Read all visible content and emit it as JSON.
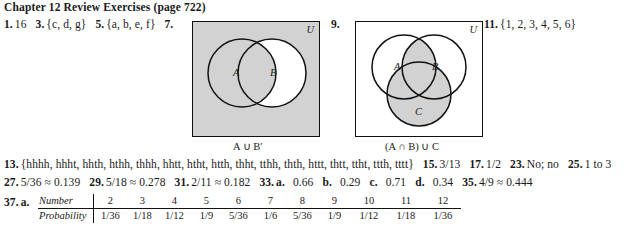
{
  "header": {
    "title": "Chapter 12 Review Exercises (page 722)"
  },
  "line1": {
    "items": [
      {
        "num": "1.",
        "text": "16"
      },
      {
        "num": "3.",
        "text": "{c, d, g}"
      },
      {
        "num": "5.",
        "text": "{a, b, e, f}"
      },
      {
        "num": "7.",
        "text": ""
      }
    ]
  },
  "venn1": {
    "problem": "7.",
    "universe_label": "U",
    "set_a_label": "A",
    "set_b_label": "B",
    "caption": "A ∪ B′",
    "shade_color": "#d2d2d2"
  },
  "venn2": {
    "problem": "9.",
    "universe_label": "U",
    "set_a_label": "A",
    "set_b_label": "B",
    "set_c_label": "C",
    "caption": "(A ∩ B) ∪ C",
    "shade_color": "#d2d2d2"
  },
  "item11": {
    "num": "11.",
    "text": "{1, 2, 3, 4, 5, 6}"
  },
  "line13": {
    "items": [
      {
        "num": "13.",
        "text": "{hhhh, hhht, hhth, hthh, thhh, hhtt, htht, htth, thht, tthh, thth, httt, thtt, ttht, ttth, tttt}"
      },
      {
        "num": "15.",
        "text": "3/13"
      },
      {
        "num": "17.",
        "text": "1/2"
      },
      {
        "num": "23.",
        "text": "No; no"
      },
      {
        "num": "25.",
        "text": "1 to 3"
      }
    ]
  },
  "line27": {
    "items": [
      {
        "num": "27.",
        "text": "5/36 ≈ 0.139"
      },
      {
        "num": "29.",
        "text": "5/18 ≈ 0.278"
      },
      {
        "num": "31.",
        "text": "2/11 ≈ 0.182"
      }
    ]
  },
  "line33": {
    "num": "33.",
    "parts": [
      {
        "label": "a.",
        "value": "0.66"
      },
      {
        "label": "b.",
        "value": "0.29"
      },
      {
        "label": "c.",
        "value": "0.71"
      },
      {
        "label": "d.",
        "value": "0.34"
      }
    ],
    "item35": {
      "num": "35.",
      "text": "4/9 ≈ 0.444"
    }
  },
  "line37": {
    "num": "37.",
    "part": "a.",
    "table": {
      "row_headers": [
        "Number",
        "Probability"
      ],
      "numbers": [
        "2",
        "3",
        "4",
        "5",
        "6",
        "7",
        "8",
        "9",
        "10",
        "11",
        "12"
      ],
      "probabilities": [
        "1/36",
        "1/18",
        "1/12",
        "1/9",
        "5/36",
        "1/6",
        "5/36",
        "1/9",
        "1/12",
        "1/18",
        "1/36"
      ]
    }
  }
}
